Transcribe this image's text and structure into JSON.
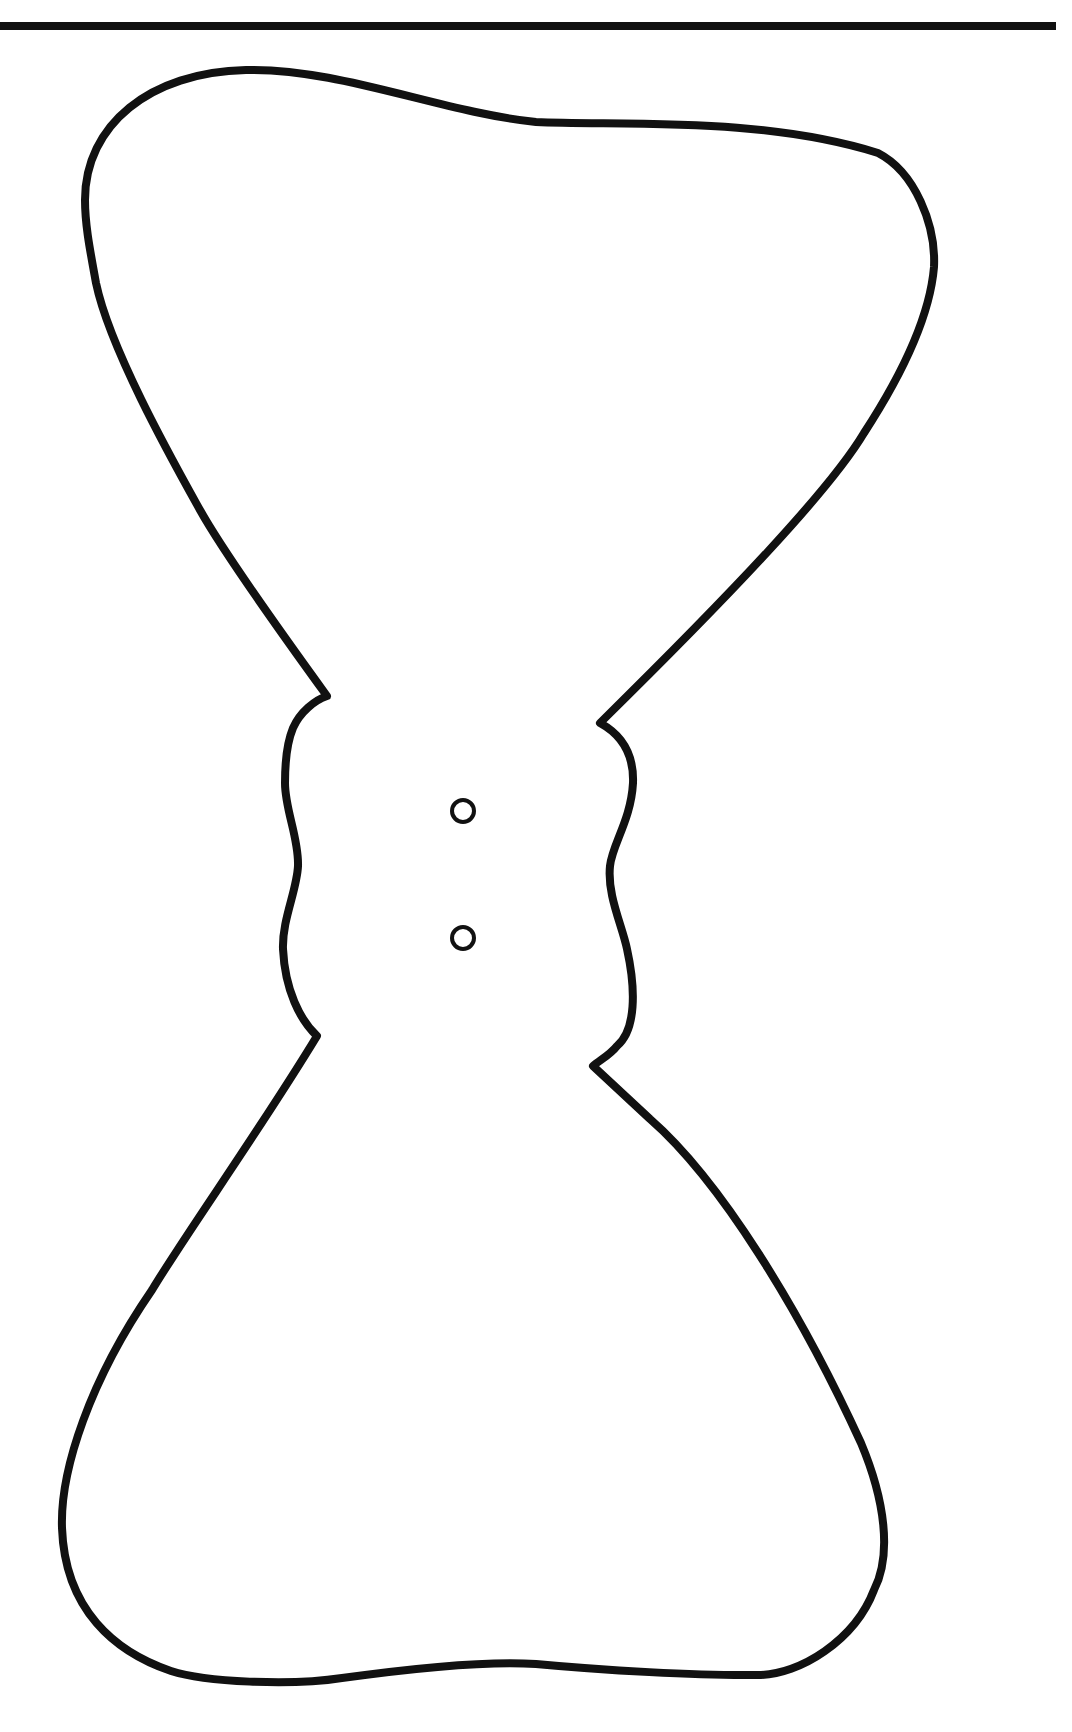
{
  "page": {
    "title": "Bow tie cut-out template",
    "background": "#ffffff"
  },
  "top_rule": {
    "color": "#111111",
    "x_start": 0,
    "x_end": 1056,
    "y": 26,
    "thickness": 8
  },
  "template": {
    "shape": "bow-tie-outline",
    "stroke_color": "#111111",
    "stroke_width": 8,
    "fill": "#ffffff",
    "holes": [
      {
        "label": "hole-top",
        "cx": 463,
        "cy": 811,
        "r": 11
      },
      {
        "label": "hole-bottom",
        "cx": 463,
        "cy": 938,
        "r": 11
      }
    ]
  }
}
